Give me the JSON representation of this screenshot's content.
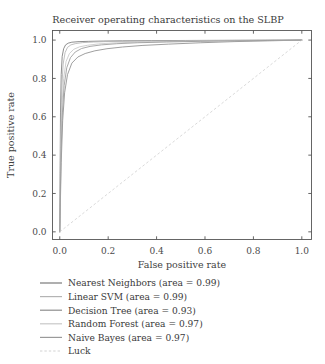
{
  "chart_data": {
    "type": "line",
    "title": "Receiver operating characteristics on the SLBP",
    "xlabel": "False positive rate",
    "ylabel": "True positive rate",
    "xlim": [
      -0.03,
      1.04
    ],
    "ylim": [
      -0.04,
      1.05
    ],
    "xticks": [
      0.0,
      0.2,
      0.4,
      0.6,
      0.8,
      1.0
    ],
    "yticks": [
      0.0,
      0.2,
      0.4,
      0.6,
      0.8,
      1.0
    ],
    "xticklabels": [
      "0.0",
      "0.2",
      "0.4",
      "0.6",
      "0.8",
      "1.0"
    ],
    "yticklabels": [
      "0.0",
      "0.2",
      "0.4",
      "0.6",
      "0.8",
      "1.0"
    ],
    "grid": false,
    "legend_position": "below-axes-left",
    "series": [
      {
        "name": "Nearest Neighbors",
        "area": 0.99,
        "legend_label": "Nearest Neighbors (area = 0.99)",
        "color": "#7a7a7a",
        "style": "solid",
        "x": [
          0.0,
          0.003,
          0.006,
          0.01,
          0.016,
          0.024,
          0.035,
          0.05,
          0.08,
          0.12,
          0.18,
          0.26,
          0.38,
          0.52,
          0.68,
          0.84,
          1.0
        ],
        "y": [
          0.0,
          0.62,
          0.82,
          0.915,
          0.955,
          0.975,
          0.984,
          0.989,
          0.992,
          0.9935,
          0.995,
          0.9962,
          0.9972,
          0.998,
          0.9988,
          0.9994,
          1.0
        ]
      },
      {
        "name": "Linear SVM",
        "area": 0.99,
        "legend_label": "Linear SVM (area = 0.99)",
        "color": "#b4b4b4",
        "style": "solid",
        "x": [
          0.0,
          0.004,
          0.008,
          0.014,
          0.022,
          0.032,
          0.046,
          0.066,
          0.095,
          0.14,
          0.2,
          0.29,
          0.41,
          0.55,
          0.7,
          0.85,
          1.0
        ],
        "y": [
          0.0,
          0.5,
          0.74,
          0.875,
          0.935,
          0.962,
          0.975,
          0.982,
          0.987,
          0.99,
          0.9925,
          0.994,
          0.9955,
          0.997,
          0.998,
          0.9992,
          1.0
        ]
      },
      {
        "name": "Decision Tree",
        "area": 0.93,
        "legend_label": "Decision Tree (area = 0.93)",
        "color": "#8e8e8e",
        "style": "solid",
        "x": [
          0.0,
          0.006,
          0.012,
          0.02,
          0.032,
          0.05,
          0.075,
          0.105,
          0.145,
          0.195,
          0.26,
          0.34,
          0.45,
          0.58,
          0.72,
          0.86,
          1.0
        ],
        "y": [
          0.0,
          0.36,
          0.58,
          0.725,
          0.82,
          0.88,
          0.912,
          0.93,
          0.944,
          0.955,
          0.964,
          0.972,
          0.979,
          0.986,
          0.992,
          0.996,
          1.0
        ]
      },
      {
        "name": "Random Forest",
        "area": 0.97,
        "legend_label": "Random Forest (area = 0.97)",
        "color": "#c8c8c8",
        "style": "solid",
        "x": [
          0.0,
          0.004,
          0.009,
          0.016,
          0.026,
          0.04,
          0.058,
          0.082,
          0.115,
          0.16,
          0.22,
          0.31,
          0.43,
          0.57,
          0.71,
          0.86,
          1.0
        ],
        "y": [
          0.0,
          0.44,
          0.66,
          0.8,
          0.888,
          0.93,
          0.952,
          0.965,
          0.973,
          0.98,
          0.985,
          0.989,
          0.992,
          0.995,
          0.997,
          0.9988,
          1.0
        ]
      },
      {
        "name": "Naive Bayes",
        "area": 0.97,
        "legend_label": "Naive Bayes (area = 0.97)",
        "color": "#9a9a9a",
        "style": "solid",
        "x": [
          0.0,
          0.005,
          0.011,
          0.018,
          0.029,
          0.044,
          0.064,
          0.09,
          0.125,
          0.172,
          0.235,
          0.32,
          0.44,
          0.58,
          0.72,
          0.86,
          1.0
        ],
        "y": [
          0.0,
          0.4,
          0.62,
          0.762,
          0.856,
          0.908,
          0.938,
          0.956,
          0.967,
          0.975,
          0.981,
          0.986,
          0.99,
          0.9935,
          0.996,
          0.998,
          1.0
        ]
      },
      {
        "name": "Luck",
        "area": null,
        "legend_label": "Luck",
        "color": "#d2d2d2",
        "style": "dashed",
        "x": [
          0.0,
          1.0
        ],
        "y": [
          0.0,
          1.0
        ]
      }
    ]
  },
  "figure": {
    "background": "#ffffff",
    "axis_color": "#555555",
    "text_color": "#3a3a3a"
  }
}
